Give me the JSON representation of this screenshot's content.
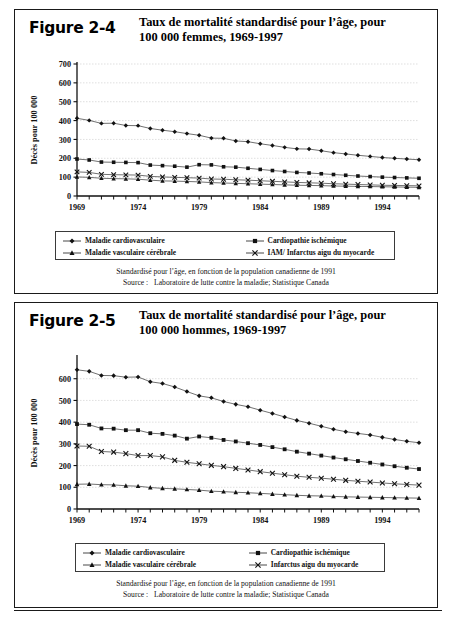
{
  "figures": [
    {
      "id": "figure-2-4",
      "label": "Figure 2-4",
      "title": "Taux de mortalité standardisé pour l’âge, pour 100 000 femmes, 1969-1997",
      "title_line1": "Taux de mortalité standardisé pour l’âge, pour",
      "title_line2": "100 000 femmes, 1969-1997",
      "footnote_line1": "Standardisé pour l’âge, en fonction de la population canadienne de 1991",
      "footnote_source_label": "Source :",
      "footnote_source_value": "Laboratoire de lutte contre la maladie; Statistique Canada",
      "legend": [
        {
          "label": "Maladie cardiovasculaire",
          "marker": "diamond"
        },
        {
          "label": "Cardiopathie ischémique",
          "marker": "square"
        },
        {
          "label": "Maladie vasculaire cérébrale",
          "marker": "triangle"
        },
        {
          "label": "IAM/ Infarctus aigu du myocarde",
          "marker": "cross"
        }
      ],
      "chart_data": {
        "type": "line",
        "title": "Taux de mortalité standardisé pour l’âge, pour 100 000 femmes, 1969-1997",
        "xlabel": "",
        "ylabel": "Décès pour 100 000",
        "ylim": [
          0,
          700
        ],
        "yticks": [
          0,
          100,
          200,
          300,
          400,
          500,
          600,
          700
        ],
        "xlim": [
          1969,
          1997
        ],
        "xticks_labeled": [
          1969,
          1974,
          1979,
          1984,
          1989,
          1994
        ],
        "grid": true,
        "legend_position": "below-axis",
        "x": [
          1969,
          1970,
          1971,
          1972,
          1973,
          1974,
          1975,
          1976,
          1977,
          1978,
          1979,
          1980,
          1981,
          1982,
          1983,
          1984,
          1985,
          1986,
          1987,
          1988,
          1989,
          1990,
          1991,
          1992,
          1993,
          1994,
          1995,
          1996,
          1997
        ],
        "series": [
          {
            "name": "Maladie cardiovasculaire",
            "marker": "diamond",
            "values": [
              412,
              401,
              385,
              386,
              374,
              373,
              358,
              349,
              341,
              331,
              322,
              307,
              306,
              292,
              288,
              277,
              268,
              258,
              250,
              249,
              240,
              230,
              223,
              216,
              210,
              204,
              200,
              196,
              192
            ]
          },
          {
            "name": "Cardiopathie ischémique",
            "marker": "square",
            "values": [
              196,
              191,
              180,
              179,
              178,
              177,
              164,
              161,
              158,
              153,
              166,
              165,
              155,
              153,
              147,
              141,
              135,
              130,
              125,
              122,
              118,
              114,
              110,
              106,
              103,
              100,
              98,
              96,
              94
            ]
          },
          {
            "name": "Maladie vasculaire cérébrale",
            "marker": "triangle",
            "values": [
              101,
              99,
              94,
              92,
              91,
              89,
              84,
              80,
              79,
              77,
              75,
              71,
              69,
              67,
              65,
              63,
              61,
              59,
              57,
              56,
              55,
              53,
              52,
              51,
              50,
              49,
              48,
              47,
              46
            ]
          },
          {
            "name": "IAM/ Infarctus aigu du myocarde",
            "marker": "cross",
            "values": [
              128,
              125,
              115,
              113,
              112,
              111,
              104,
              101,
              99,
              97,
              95,
              90,
              89,
              86,
              84,
              81,
              78,
              75,
              72,
              70,
              68,
              65,
              63,
              61,
              59,
              57,
              56,
              55,
              54
            ]
          }
        ]
      }
    },
    {
      "id": "figure-2-5",
      "label": "Figure 2-5",
      "title": "Taux de mortalité standardisé pour l’âge, pour 100 000 hommes, 1969-1997",
      "title_line1": "Taux de mortalité standardisé pour l’âge, pour",
      "title_line2": "100 000 hommes, 1969-1997",
      "footnote_line1": "Standardisé pour l’âge, en fonction de la population canadienne de 1991",
      "footnote_source_label": "Source :",
      "footnote_source_value": "Laboratoire de lutte contre la maladie; Statistique Canada",
      "legend": [
        {
          "label": "Maladie cardiovasculaire",
          "marker": "diamond"
        },
        {
          "label": "Cardiopathie ischémique",
          "marker": "square"
        },
        {
          "label": "Maladie vasculaire cérébrale",
          "marker": "triangle"
        },
        {
          "label": "Infarctus aigu du myocarde",
          "marker": "cross"
        }
      ],
      "chart_data": {
        "type": "line",
        "title": "Taux de mortalité standardisé pour l’âge, pour 100 000 hommes, 1969-1997",
        "xlabel": "",
        "ylabel": "Décès pour 100 000",
        "ylim": [
          0,
          700
        ],
        "yticks": [
          0,
          100,
          200,
          300,
          400,
          500,
          600
        ],
        "xlim": [
          1969,
          1997
        ],
        "xticks_labeled": [
          1969,
          1974,
          1979,
          1984,
          1989,
          1994
        ],
        "grid": true,
        "legend_position": "below-axis",
        "x": [
          1969,
          1970,
          1971,
          1972,
          1973,
          1974,
          1975,
          1976,
          1977,
          1978,
          1979,
          1980,
          1981,
          1982,
          1983,
          1984,
          1985,
          1986,
          1987,
          1988,
          1989,
          1990,
          1991,
          1992,
          1993,
          1994,
          1995,
          1996,
          1997
        ],
        "series": [
          {
            "name": "Maladie cardiovasculaire",
            "marker": "diamond",
            "values": [
              641,
              634,
              615,
              614,
              607,
              608,
              586,
              578,
              562,
              541,
              521,
              512,
              495,
              482,
              471,
              455,
              440,
              424,
              408,
              395,
              381,
              367,
              356,
              348,
              341,
              330,
              320,
              312,
              305
            ]
          },
          {
            "name": "Cardiopathie ischémique",
            "marker": "square",
            "values": [
              391,
              388,
              371,
              370,
              363,
              363,
              349,
              346,
              338,
              324,
              334,
              328,
              318,
              311,
              303,
              295,
              285,
              275,
              264,
              255,
              246,
              237,
              229,
              221,
              213,
              205,
              197,
              190,
              184
            ]
          },
          {
            "name": "Maladie vasculaire cérébrale",
            "marker": "triangle",
            "values": [
              114,
              115,
              112,
              111,
              107,
              105,
              99,
              95,
              93,
              90,
              87,
              82,
              80,
              77,
              75,
              72,
              69,
              66,
              63,
              61,
              60,
              58,
              56,
              55,
              54,
              53,
              52,
              51,
              50
            ]
          },
          {
            "name": "Infarctus aigu du myocarde",
            "marker": "cross",
            "values": [
              290,
              289,
              265,
              262,
              255,
              246,
              246,
              240,
              224,
              215,
              208,
              201,
              195,
              187,
              180,
              172,
              165,
              158,
              151,
              146,
              142,
              137,
              132,
              128,
              124,
              120,
              116,
              113,
              110
            ]
          }
        ]
      }
    }
  ]
}
